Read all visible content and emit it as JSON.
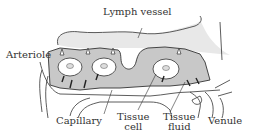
{
  "diagram": {
    "type": "anatomical illustration",
    "labels": {
      "lymph_vessel": "Lymph vessel",
      "arteriole": "Arteriole",
      "capillary": "Capillary",
      "tissue_cell_line1": "Tissue",
      "tissue_cell_line2": "cell",
      "tissue_fluid_line1": "Tissue",
      "tissue_fluid_line2": "fluid",
      "venule": "Venule"
    },
    "colors": {
      "line": "#333333",
      "tissue_fill": "#c8c8c8",
      "lymph_fill": "#e6e6e6",
      "background": "#ffffff"
    }
  }
}
